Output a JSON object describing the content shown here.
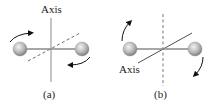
{
  "figure": {
    "panels": [
      {
        "id": "a",
        "caption": "(a)",
        "axis_label": "Axis",
        "axis_orientation": "vertical",
        "axis_style": "solid",
        "reference_style": "dashed-diagonal"
      },
      {
        "id": "b",
        "caption": "(b)",
        "axis_label": "Axis",
        "axis_orientation": "diagonal",
        "axis_style": "solid",
        "reference_style": "dashed-vertical"
      }
    ],
    "colors": {
      "rod": "#8a8a8a",
      "ball_light": "#e6e6e6",
      "ball_dark": "#8c8c8c",
      "axis": "#7a7a7a",
      "arrow": "#111111"
    }
  }
}
